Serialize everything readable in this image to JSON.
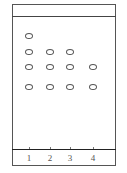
{
  "diagram": {
    "type": "thin-layer-chromatography-plate",
    "colors": {
      "border": "#555555",
      "spot_outline": "#555555",
      "label": "#555555",
      "background": "#ffffff"
    },
    "lanes": [
      {
        "label": "1",
        "x": 29,
        "spots_y": [
          36,
          52,
          67,
          87
        ]
      },
      {
        "label": "2",
        "x": 50,
        "spots_y": [
          52,
          67,
          87
        ]
      },
      {
        "label": "3",
        "x": 70,
        "spots_y": [
          52,
          67,
          87
        ]
      },
      {
        "label": "4",
        "x": 93,
        "spots_y": [
          67,
          87
        ]
      }
    ]
  }
}
